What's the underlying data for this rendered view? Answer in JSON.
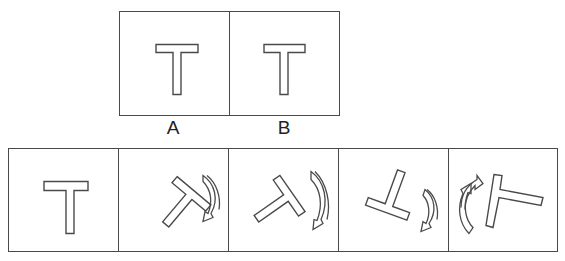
{
  "question": {
    "reference_panels": [
      {
        "label": "A",
        "figure": "t-shape",
        "rotation_deg": 0
      },
      {
        "label": "B",
        "figure": "t-shape",
        "rotation_deg": 0
      }
    ],
    "sequence_panels": [
      {
        "index": 1,
        "figure": "t-shape",
        "rotation_deg": 0,
        "arrow": "none"
      },
      {
        "index": 2,
        "figure": "t-shape",
        "rotation_deg": -50,
        "arrow": "curved-rotate-arrow-right"
      },
      {
        "index": 3,
        "figure": "t-shape",
        "rotation_deg": 145,
        "arrow": "curved-rotate-arrow-right"
      },
      {
        "index": 4,
        "figure": "t-shape",
        "rotation_deg": 200,
        "arrow": "curved-rotate-arrow-right"
      },
      {
        "index": 5,
        "figure": "t-shape",
        "rotation_deg": 100,
        "arrow": "curved-rotate-arrow-left"
      }
    ]
  },
  "labels": {
    "a": "A",
    "b": "B"
  },
  "colors": {
    "stroke": "#4a4a4a",
    "background": "#ffffff"
  }
}
